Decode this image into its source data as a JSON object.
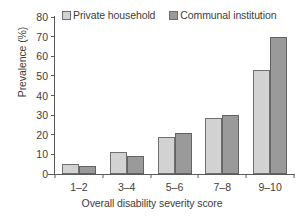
{
  "chart_data": {
    "type": "bar",
    "title": "",
    "xlabel": "Overall disability severity score",
    "ylabel": "Prevalence (%)",
    "categories": [
      "1–2",
      "3–4",
      "5–6",
      "7–8",
      "9–10"
    ],
    "series": [
      {
        "name": "Private household",
        "values": [
          5,
          11,
          19,
          28.5,
          53
        ],
        "color": "#d2d2d2"
      },
      {
        "name": "Communal institution",
        "values": [
          4,
          9,
          21,
          30,
          70
        ],
        "color": "#9a9a9a"
      }
    ],
    "ylim": [
      0,
      80
    ],
    "yticks": [
      0,
      10,
      20,
      30,
      40,
      50,
      60,
      70,
      80
    ],
    "ytick_labels": [
      "0",
      "10",
      "20",
      "30",
      "40",
      "50",
      "60",
      "70",
      "80"
    ],
    "grid": false,
    "legend_position": "top"
  },
  "legend": {
    "entries": [
      {
        "label": "Private household"
      },
      {
        "label": "Communal institution"
      }
    ]
  }
}
